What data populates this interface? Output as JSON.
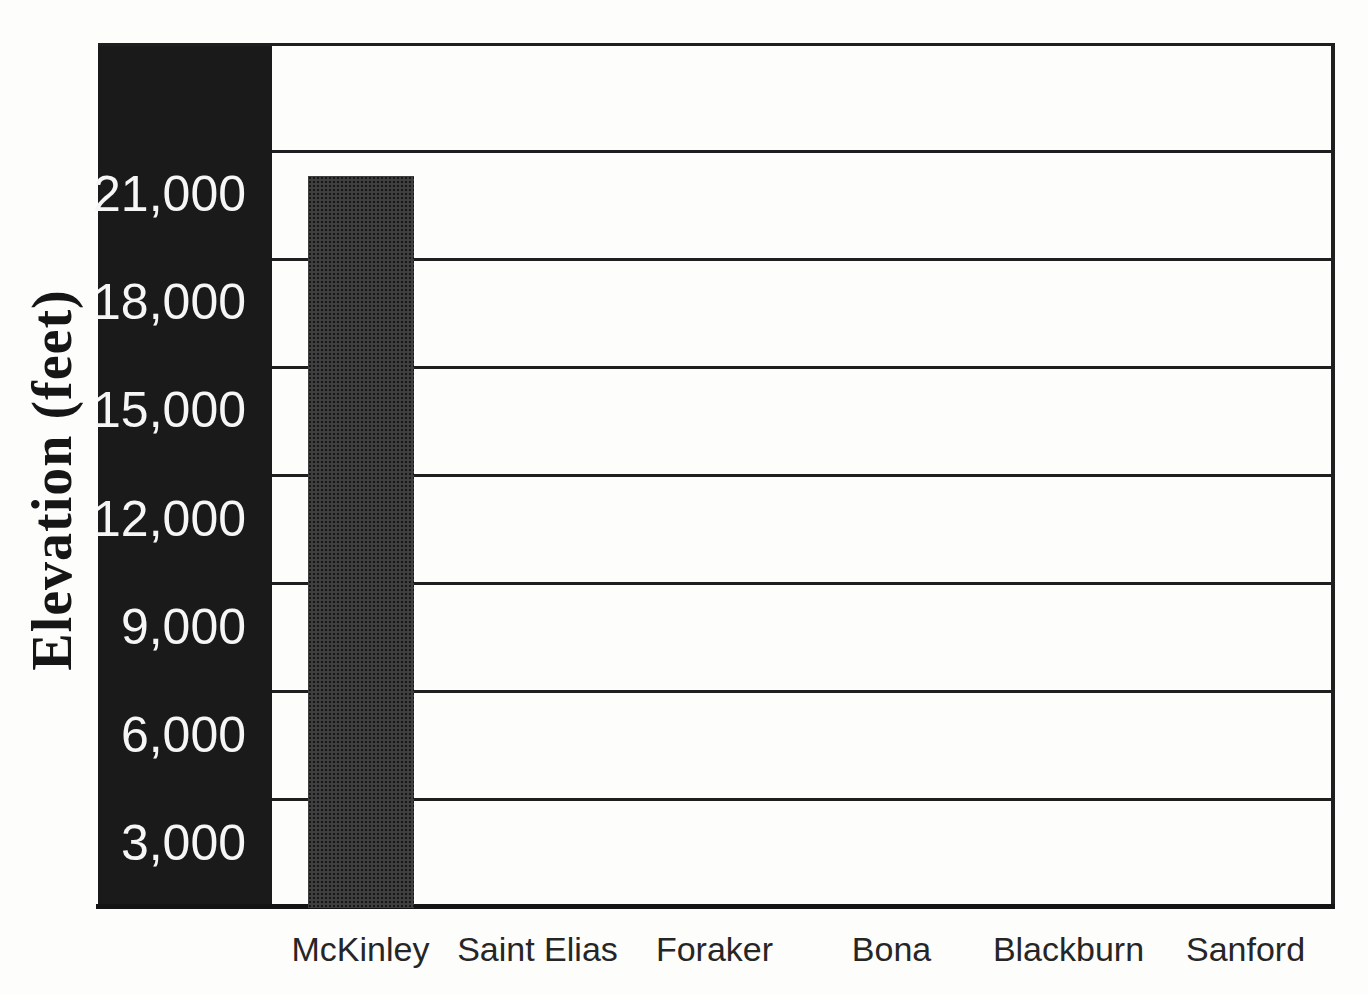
{
  "chart_data": {
    "type": "bar",
    "title": "",
    "xlabel": "",
    "ylabel": "Elevation (feet)",
    "categories": [
      "McKinley",
      "Saint Elias",
      "Foraker",
      "Bona",
      "Blackburn",
      "Sanford"
    ],
    "values": [
      20320,
      null,
      null,
      null,
      null,
      null
    ],
    "ylim": [
      0,
      24000
    ],
    "ytick_interval": 3000,
    "yticks": [
      21000,
      18000,
      15000,
      12000,
      9000,
      6000,
      3000
    ],
    "ytick_labels": [
      "21,000",
      "18,000",
      "15,000",
      "12,000",
      "9,000",
      "6,000",
      "3,000"
    ],
    "grid": "horizontal",
    "legend": "none",
    "bar_color": "#3f3f3f",
    "band_color": "#1a1a1a",
    "grid_color": "#1f1f1f",
    "tick_label_color": "#f6f6f6",
    "x_label_color": "#262626",
    "background_color": "#fdfdfc"
  }
}
